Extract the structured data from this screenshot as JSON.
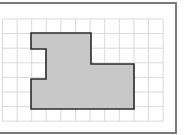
{
  "figure": {
    "frame": {
      "x": -2,
      "y": 3,
      "width": 178,
      "height": 130,
      "stroke": "#7a7a7a"
    },
    "grid": {
      "x0": 2.5,
      "y0": 19,
      "cell": 14.6,
      "cols": 11,
      "rows": 7,
      "stroke": "#d9d9d9"
    },
    "shape": {
      "points": "31,33 91,33 91,64 134,64 134,109 31,109 31,79 46,79 46,49 31,49",
      "fill": "#c8c8c8",
      "stroke": "#2b2b2b"
    }
  }
}
